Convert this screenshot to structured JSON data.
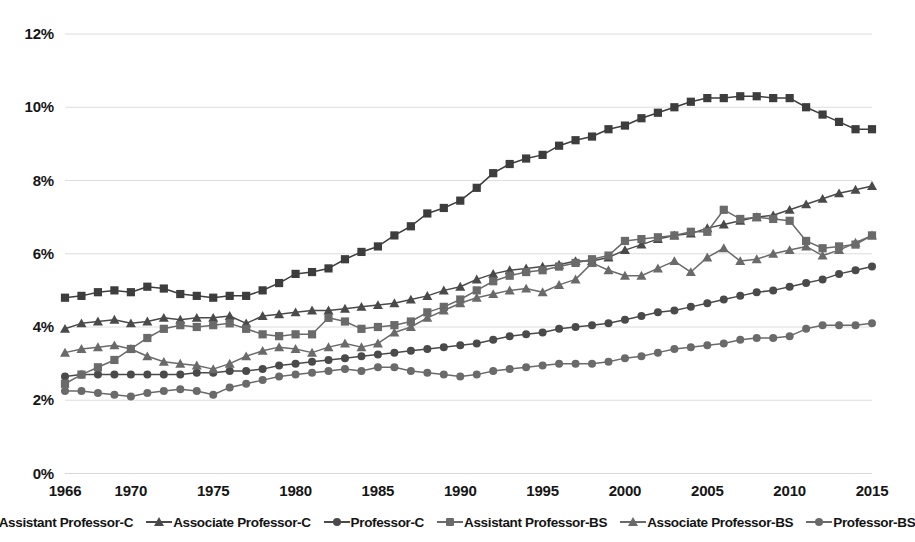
{
  "chart_data": {
    "type": "line",
    "title": "",
    "xlabel": "",
    "ylabel": "",
    "xlim": [
      1966,
      2015
    ],
    "ylim": [
      0,
      12
    ],
    "grid": true,
    "legend_position": "bottom",
    "y_ticks": [
      "0%",
      "2%",
      "4%",
      "6%",
      "8%",
      "10%",
      "12%"
    ],
    "y_tick_values": [
      0,
      2,
      4,
      6,
      8,
      10,
      12
    ],
    "x_ticks": [
      "1966",
      "1970",
      "1975",
      "1980",
      "1985",
      "1990",
      "1995",
      "2000",
      "2005",
      "2010",
      "2015"
    ],
    "x_tick_values": [
      1966,
      1970,
      1975,
      1980,
      1985,
      1990,
      1995,
      2000,
      2005,
      2010,
      2015
    ],
    "x": [
      1966,
      1967,
      1968,
      1969,
      1970,
      1971,
      1972,
      1973,
      1974,
      1975,
      1976,
      1977,
      1978,
      1979,
      1980,
      1981,
      1982,
      1983,
      1984,
      1985,
      1986,
      1987,
      1988,
      1989,
      1990,
      1991,
      1992,
      1993,
      1994,
      1995,
      1996,
      1997,
      1998,
      1999,
      2000,
      2001,
      2002,
      2003,
      2004,
      2005,
      2006,
      2007,
      2008,
      2009,
      2010,
      2011,
      2012,
      2013,
      2014,
      2015
    ],
    "series": [
      {
        "name": "Assistant Professor-C",
        "marker": "square",
        "color": "#3d3d3d",
        "values": [
          4.8,
          4.85,
          4.95,
          5.0,
          4.95,
          5.1,
          5.05,
          4.9,
          4.85,
          4.8,
          4.85,
          4.85,
          5.0,
          5.2,
          5.45,
          5.5,
          5.6,
          5.85,
          6.05,
          6.2,
          6.5,
          6.75,
          7.1,
          7.25,
          7.45,
          7.8,
          8.2,
          8.45,
          8.6,
          8.7,
          8.95,
          9.1,
          9.2,
          9.4,
          9.5,
          9.7,
          9.85,
          10.0,
          10.15,
          10.25,
          10.25,
          10.3,
          10.3,
          10.25,
          10.25,
          10.0,
          9.8,
          9.6,
          9.4,
          9.4
        ]
      },
      {
        "name": "Associate Professor-C",
        "marker": "triangle",
        "color": "#4a4a4a",
        "values": [
          3.95,
          4.1,
          4.15,
          4.2,
          4.1,
          4.15,
          4.25,
          4.2,
          4.25,
          4.25,
          4.3,
          4.1,
          4.3,
          4.35,
          4.4,
          4.45,
          4.45,
          4.5,
          4.55,
          4.6,
          4.65,
          4.75,
          4.85,
          5.0,
          5.1,
          5.3,
          5.45,
          5.55,
          5.6,
          5.65,
          5.7,
          5.8,
          5.8,
          5.9,
          6.1,
          6.25,
          6.4,
          6.5,
          6.55,
          6.7,
          6.8,
          6.9,
          7.0,
          7.05,
          7.2,
          7.35,
          7.5,
          7.65,
          7.75,
          7.85
        ]
      },
      {
        "name": "Professor-C",
        "marker": "circle",
        "color": "#4a4a4a",
        "values": [
          2.65,
          2.7,
          2.7,
          2.7,
          2.7,
          2.7,
          2.7,
          2.7,
          2.75,
          2.75,
          2.8,
          2.8,
          2.85,
          2.95,
          3.0,
          3.05,
          3.1,
          3.15,
          3.2,
          3.25,
          3.3,
          3.35,
          3.4,
          3.45,
          3.5,
          3.55,
          3.65,
          3.75,
          3.8,
          3.85,
          3.95,
          4.0,
          4.05,
          4.1,
          4.2,
          4.3,
          4.4,
          4.45,
          4.55,
          4.65,
          4.75,
          4.85,
          4.95,
          5.0,
          5.1,
          5.2,
          5.3,
          5.45,
          5.55,
          5.65
        ]
      },
      {
        "name": "Assistant Professor-BS",
        "marker": "square",
        "color": "#6a6a6a",
        "values": [
          2.45,
          2.7,
          2.9,
          3.1,
          3.4,
          3.7,
          3.95,
          4.05,
          4.0,
          4.05,
          4.1,
          3.95,
          3.8,
          3.75,
          3.8,
          3.8,
          4.25,
          4.15,
          3.95,
          4.0,
          4.05,
          4.15,
          4.4,
          4.55,
          4.75,
          5.0,
          5.25,
          5.4,
          5.5,
          5.55,
          5.65,
          5.75,
          5.85,
          5.95,
          6.35,
          6.4,
          6.45,
          6.5,
          6.6,
          6.6,
          7.2,
          6.95,
          7.0,
          6.95,
          6.9,
          6.35,
          6.15,
          6.2,
          6.25,
          6.5
        ]
      },
      {
        "name": "Associate Professor-BS",
        "marker": "triangle",
        "color": "#6a6a6a",
        "values": [
          3.3,
          3.4,
          3.45,
          3.5,
          3.4,
          3.2,
          3.05,
          3.0,
          2.95,
          2.85,
          3.0,
          3.2,
          3.35,
          3.45,
          3.4,
          3.3,
          3.45,
          3.55,
          3.45,
          3.55,
          3.85,
          4.0,
          4.25,
          4.45,
          4.65,
          4.8,
          4.9,
          5.0,
          5.05,
          4.95,
          5.15,
          5.3,
          5.75,
          5.55,
          5.4,
          5.4,
          5.6,
          5.8,
          5.5,
          5.9,
          6.15,
          5.8,
          5.85,
          6.0,
          6.1,
          6.2,
          5.95,
          6.1,
          6.3,
          6.5
        ]
      },
      {
        "name": "Professor-BS",
        "marker": "circle",
        "color": "#6a6a6a",
        "values": [
          2.25,
          2.25,
          2.2,
          2.15,
          2.1,
          2.2,
          2.25,
          2.3,
          2.25,
          2.15,
          2.35,
          2.45,
          2.55,
          2.65,
          2.7,
          2.75,
          2.8,
          2.85,
          2.8,
          2.9,
          2.9,
          2.8,
          2.75,
          2.7,
          2.65,
          2.7,
          2.8,
          2.85,
          2.9,
          2.95,
          3.0,
          3.0,
          3.0,
          3.05,
          3.15,
          3.2,
          3.3,
          3.4,
          3.45,
          3.5,
          3.55,
          3.65,
          3.7,
          3.7,
          3.75,
          3.95,
          4.05,
          4.05,
          4.05,
          4.1
        ]
      }
    ]
  },
  "legend": {
    "items": [
      {
        "label": "Assistant Professor-C",
        "marker": "square-marker-icon"
      },
      {
        "label": "Associate Professor-C",
        "marker": "triangle-marker-icon"
      },
      {
        "label": "Professor-C",
        "marker": "circle-marker-icon"
      },
      {
        "label": "Assistant Professor-BS",
        "marker": "square-marker-icon"
      },
      {
        "label": "Associate Professor-BS",
        "marker": "triangle-marker-icon"
      },
      {
        "label": "Professor-BS",
        "marker": "circle-marker-icon"
      }
    ]
  },
  "colors": {
    "series_dark": "#3d3d3d",
    "series_mid": "#4a4a4a",
    "series_light": "#6a6a6a",
    "gridline": "#d9d9d9",
    "text": "#161616",
    "background": "#ffffff"
  }
}
